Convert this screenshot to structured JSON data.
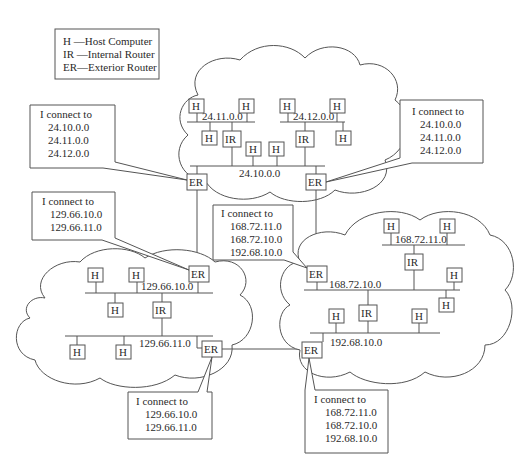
{
  "legend": {
    "items": [
      {
        "code": "H",
        "text": "H  —Host Computer"
      },
      {
        "code": "IR",
        "text": "IR —Internal Router"
      },
      {
        "code": "ER",
        "text": "ER—Exterior Router"
      }
    ]
  },
  "node_labels": {
    "host": "H",
    "internal_router": "IR",
    "exterior_router": "ER"
  },
  "networks": {
    "n24_11": "24.11.0.0",
    "n24_12": "24.12.0.0",
    "n24_10": "24.10.0.0",
    "n129_10": "129.66.10.0",
    "n129_11": "129.66.11.0",
    "n168_11": "168.72.11.0",
    "n168_10": "168.72.10.0",
    "n192_10": "192.68.10.0"
  },
  "callouts": {
    "top_left": {
      "title": "I connect to",
      "lines": [
        "24.10.0.0",
        "24.11.0.0",
        "24.12.0.0"
      ]
    },
    "top_right": {
      "title": "I connect to",
      "lines": [
        "24.10.0.0",
        "24.11.0.0",
        "24.12.0.0"
      ]
    },
    "mid_left": {
      "title": "I connect to",
      "lines": [
        "129.66.10.0",
        "129.66.11.0"
      ]
    },
    "center": {
      "title": "I connect to",
      "lines": [
        "168.72.11.0",
        "168.72.10.0",
        "192.68.10.0"
      ]
    },
    "bottom_left": {
      "title": "I connect to",
      "lines": [
        "129.66.10.0",
        "129.66.11.0"
      ]
    },
    "bottom_right": {
      "title": "I connect to",
      "lines": [
        "168.72.11.0",
        "168.72.10.0",
        "192.68.10.0"
      ]
    }
  }
}
